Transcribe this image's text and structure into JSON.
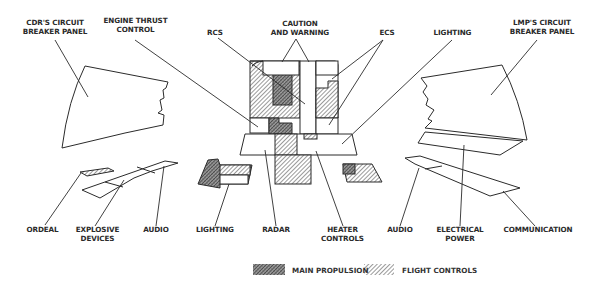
{
  "diagram": {
    "top_labels": {
      "cdr_panel": [
        "CDR'S CIRCUIT",
        "BREAKER PANEL"
      ],
      "engine_thrust": [
        "ENGINE THRUST",
        "CONTROL"
      ],
      "rcs": [
        "RCS"
      ],
      "caution_warning": [
        "CAUTION",
        "AND WARNING"
      ],
      "ecs": [
        "ECS"
      ],
      "lighting_top": [
        "LIGHTING"
      ],
      "lmp_panel": [
        "LMP'S CIRCUIT",
        "BREAKER PANEL"
      ]
    },
    "bottom_labels": {
      "ordeal": [
        "ORDEAL"
      ],
      "explosive": [
        "EXPLOSIVE",
        "DEVICES"
      ],
      "audio_left": [
        "AUDIO"
      ],
      "lighting_bottom": [
        "LIGHTING"
      ],
      "radar": [
        "RADAR"
      ],
      "heater": [
        "HEATER",
        "CONTROLS"
      ],
      "audio_right": [
        "AUDIO"
      ],
      "electrical": [
        "ELECTRICAL",
        "POWER"
      ],
      "communication": [
        "COMMUNICATION"
      ]
    },
    "legend": {
      "items": [
        {
          "label": "MAIN PROPULSION",
          "pattern": "dense-crosshatch",
          "color": "#6a6a6a"
        },
        {
          "label": "FLIGHT CONTROLS",
          "pattern": "diagonal-hatch",
          "color": "#8a8a8a"
        }
      ]
    },
    "colors": {
      "line": "#2b2b2b",
      "text": "#2a2a2a",
      "background": "#ffffff"
    }
  }
}
